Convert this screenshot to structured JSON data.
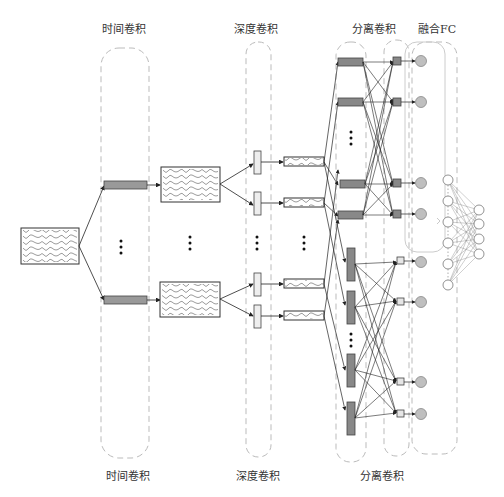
{
  "labels": {
    "top": {
      "temporal_conv": "时间卷积",
      "depth_conv": "深度卷积",
      "separable_conv": "分离卷积",
      "fusion_fc": "融合FC"
    },
    "bottom": {
      "temporal_conv": "时间卷积",
      "depth_conv": "深度卷积",
      "separable_conv": "分离卷积"
    }
  },
  "colors": {
    "dashed_border": "#bbbbbb",
    "dark_bar": "#888888",
    "light_box": "#e6e6e6",
    "circle_fill": "#bfbfbf",
    "line": "#222222"
  },
  "structure": {
    "input_signal": "multi-channel EEG",
    "temporal_branches": 2,
    "depth_filters_per_branch": 2,
    "separable_upper_bars": 4,
    "separable_lower_bars": 4,
    "output_nodes_upper": 4,
    "output_nodes_lower": 4,
    "fc_input_nodes": 6,
    "fc_output_nodes": 4,
    "ellipsis": "⋮"
  }
}
